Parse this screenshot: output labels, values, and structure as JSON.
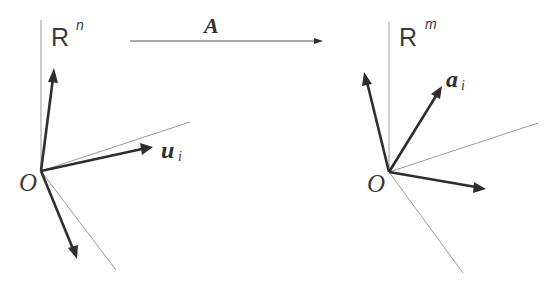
{
  "diagram": {
    "map": {
      "label": "A",
      "arrow": {
        "x1": 130,
        "y1": 41,
        "x2": 322,
        "y2": 41
      }
    },
    "left_space": {
      "space_label": "R",
      "space_sup": "n",
      "origin_label": "O",
      "origin": {
        "x": 41,
        "y": 171
      },
      "vector_label": "u",
      "vector_sub": "i",
      "axes": [
        {
          "name": "vertical-axis",
          "x2": 41,
          "y2": 20
        },
        {
          "name": "upper-right-axis",
          "x2": 190,
          "y2": 122
        },
        {
          "name": "lower-right-axis",
          "x2": 116,
          "y2": 270
        }
      ],
      "vectors": [
        {
          "name": "up-vector",
          "x2": 54,
          "y2": 68
        },
        {
          "name": "u-i-vector",
          "x2": 152,
          "y2": 147
        },
        {
          "name": "down-vector",
          "x2": 77,
          "y2": 258
        }
      ]
    },
    "right_space": {
      "space_label": "R",
      "space_sup": "m",
      "origin_label": "O",
      "origin": {
        "x": 389,
        "y": 172
      },
      "vector_label": "a",
      "vector_sub": "i",
      "axes": [
        {
          "name": "vertical-axis",
          "x2": 389,
          "y2": 22
        },
        {
          "name": "upper-right-axis",
          "x2": 538,
          "y2": 123
        },
        {
          "name": "lower-right-axis",
          "x2": 463,
          "y2": 273
        }
      ],
      "vectors": [
        {
          "name": "up-left-vector",
          "x2": 364,
          "y2": 72
        },
        {
          "name": "a-i-vector",
          "x2": 441,
          "y2": 87
        },
        {
          "name": "right-vector",
          "x2": 486,
          "y2": 189
        }
      ]
    },
    "colors": {
      "axis": "#9a9a9a",
      "vector": "#2e2e2e",
      "text": "#3a3a3a",
      "background": "#ffffff"
    }
  }
}
